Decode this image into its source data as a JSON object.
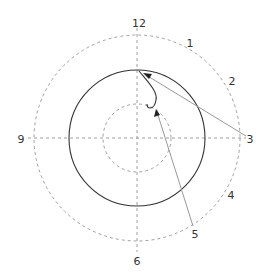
{
  "diagram": {
    "type": "clock-face-trajectory",
    "center": [
      137,
      138
    ],
    "colors": {
      "line": "#333333",
      "dashed": "#777777",
      "pointer": "#888888"
    },
    "circles": [
      {
        "name": "outer-dashed-circle",
        "r": 103,
        "style": "dashed"
      },
      {
        "name": "solid-circle",
        "r": 68,
        "style": "solid"
      },
      {
        "name": "inner-dashed-circle",
        "r": 34,
        "style": "dashed"
      }
    ],
    "labels": {
      "h12": "12",
      "h1": "1",
      "h2": "2",
      "h3": "3",
      "h4": "4",
      "h5": "5",
      "h6": "6",
      "h9": "9"
    }
  }
}
